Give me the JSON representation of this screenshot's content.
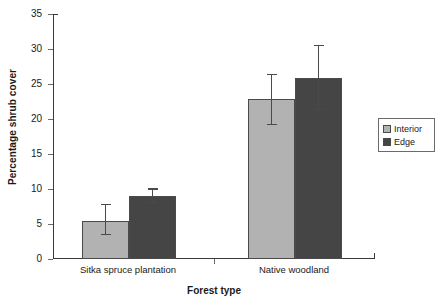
{
  "chart_data": {
    "type": "bar",
    "title": "",
    "xlabel": "Forest type",
    "ylabel": "Percentage shrub cover",
    "categories": [
      "Sitka spruce plantation",
      "Native woodland"
    ],
    "series": [
      {
        "name": "Interior",
        "color": "#b2b2b2",
        "values": [
          5.4,
          22.8
        ],
        "error_upper": [
          2.5,
          3.6
        ],
        "error_lower": [
          2.0,
          3.7
        ],
        "ci_upper": [
          7.9,
          26.4
        ],
        "ci_lower": [
          3.4,
          19.1
        ]
      },
      {
        "name": "Edge",
        "color": "#454545",
        "values": [
          9.0,
          25.8
        ],
        "error_upper": [
          1.1,
          4.8
        ],
        "error_lower": [
          1.0,
          4.5
        ],
        "ci_upper": [
          10.1,
          30.6
        ],
        "ci_lower": [
          8.0,
          21.3
        ]
      }
    ],
    "ylim": [
      0,
      35
    ],
    "yticks": [
      0,
      5,
      10,
      15,
      20,
      25,
      30,
      35
    ],
    "ytick_labels": [
      "0",
      "5",
      "10",
      "15",
      "20",
      "25",
      "30",
      "35"
    ],
    "grid": false,
    "legend_position": "right",
    "error_bar_style": "capped"
  },
  "axes": {
    "y_title": "Percentage shrub cover",
    "x_title": "Forest type"
  },
  "legend": {
    "entries": [
      {
        "label": "Interior",
        "color": "#b2b2b2"
      },
      {
        "label": "Edge",
        "color": "#454545"
      }
    ]
  }
}
